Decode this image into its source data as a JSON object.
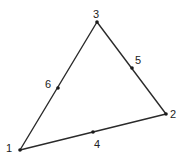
{
  "diagram": {
    "type": "triangular-element",
    "line_color": "#2a2a2a",
    "nodes": [
      {
        "id": "1",
        "label": "1",
        "role": "corner",
        "x": 20,
        "y": 150,
        "label_x": 6,
        "label_y": 152
      },
      {
        "id": "2",
        "label": "2",
        "role": "corner",
        "x": 166,
        "y": 114,
        "label_x": 170,
        "label_y": 118
      },
      {
        "id": "3",
        "label": "3",
        "role": "corner",
        "x": 97,
        "y": 22,
        "label_x": 93,
        "label_y": 18
      },
      {
        "id": "4",
        "label": "4",
        "role": "midside",
        "x": 93,
        "y": 132,
        "label_x": 94,
        "label_y": 148
      },
      {
        "id": "5",
        "label": "5",
        "role": "midside",
        "x": 132,
        "y": 68,
        "label_x": 135,
        "label_y": 64
      },
      {
        "id": "6",
        "label": "6",
        "role": "midside",
        "x": 58,
        "y": 88,
        "label_x": 45,
        "label_y": 88
      }
    ],
    "edges": [
      {
        "from": "1",
        "to": "2",
        "mid": "4"
      },
      {
        "from": "2",
        "to": "3",
        "mid": "5"
      },
      {
        "from": "3",
        "to": "1",
        "mid": "6"
      }
    ]
  }
}
